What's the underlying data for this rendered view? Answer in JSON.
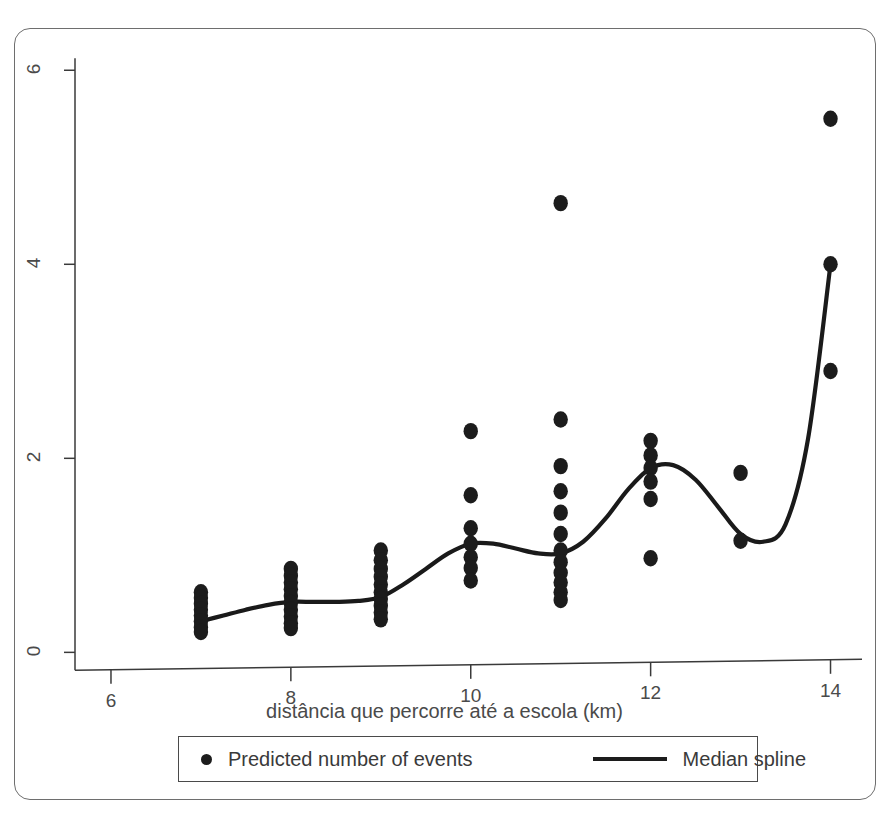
{
  "chart_data": {
    "type": "scatter",
    "title": "",
    "subtitle": "",
    "xlabel": "distância que percorre até a escola (km)",
    "ylabel": "",
    "xlim": [
      5.6,
      14.35
    ],
    "ylim": [
      -0.12,
      6.25
    ],
    "xticks": [
      6,
      8,
      10,
      12,
      14
    ],
    "xticklabels": [
      "6",
      "8",
      "10",
      "12",
      "14"
    ],
    "yticks": [
      0,
      2,
      4,
      6
    ],
    "yticklabels": [
      "0",
      "2",
      "4",
      "6"
    ],
    "ytick_label_rotation": 90,
    "grid": false,
    "legend_position": "below-axes",
    "point_color": "#1c1c1c",
    "line_color": "#1a1a1a",
    "frame_color": "#6e6e6e",
    "legend": [
      {
        "marker": "dot",
        "label": "Predicted number of events"
      },
      {
        "marker": "line",
        "label": "Median spline"
      }
    ],
    "series": [
      {
        "name": "Predicted number of events",
        "marker": "dot",
        "points": [
          {
            "x": 7,
            "y": 0.62
          },
          {
            "x": 7,
            "y": 0.56
          },
          {
            "x": 7,
            "y": 0.5
          },
          {
            "x": 7,
            "y": 0.44
          },
          {
            "x": 7,
            "y": 0.38
          },
          {
            "x": 7,
            "y": 0.32
          },
          {
            "x": 7,
            "y": 0.26
          },
          {
            "x": 7,
            "y": 0.21
          },
          {
            "x": 8,
            "y": 0.86
          },
          {
            "x": 8,
            "y": 0.79
          },
          {
            "x": 8,
            "y": 0.72
          },
          {
            "x": 8,
            "y": 0.65
          },
          {
            "x": 8,
            "y": 0.58
          },
          {
            "x": 8,
            "y": 0.51
          },
          {
            "x": 8,
            "y": 0.44
          },
          {
            "x": 8,
            "y": 0.37
          },
          {
            "x": 8,
            "y": 0.3
          },
          {
            "x": 8,
            "y": 0.25
          },
          {
            "x": 9,
            "y": 1.05
          },
          {
            "x": 9,
            "y": 0.95
          },
          {
            "x": 9,
            "y": 0.86
          },
          {
            "x": 9,
            "y": 0.78
          },
          {
            "x": 9,
            "y": 0.7
          },
          {
            "x": 9,
            "y": 0.62
          },
          {
            "x": 9,
            "y": 0.55
          },
          {
            "x": 9,
            "y": 0.48
          },
          {
            "x": 9,
            "y": 0.41
          },
          {
            "x": 9,
            "y": 0.34
          },
          {
            "x": 10,
            "y": 2.28
          },
          {
            "x": 10,
            "y": 1.62
          },
          {
            "x": 10,
            "y": 1.28
          },
          {
            "x": 10,
            "y": 1.12
          },
          {
            "x": 10,
            "y": 0.98
          },
          {
            "x": 10,
            "y": 0.87
          },
          {
            "x": 10,
            "y": 0.74
          },
          {
            "x": 11,
            "y": 4.63
          },
          {
            "x": 11,
            "y": 2.4
          },
          {
            "x": 11,
            "y": 1.92
          },
          {
            "x": 11,
            "y": 1.66
          },
          {
            "x": 11,
            "y": 1.44
          },
          {
            "x": 11,
            "y": 1.22
          },
          {
            "x": 11,
            "y": 1.05
          },
          {
            "x": 11,
            "y": 0.93
          },
          {
            "x": 11,
            "y": 0.82
          },
          {
            "x": 11,
            "y": 0.72
          },
          {
            "x": 11,
            "y": 0.62
          },
          {
            "x": 11,
            "y": 0.54
          },
          {
            "x": 12,
            "y": 2.18
          },
          {
            "x": 12,
            "y": 2.03
          },
          {
            "x": 12,
            "y": 1.9
          },
          {
            "x": 12,
            "y": 1.76
          },
          {
            "x": 12,
            "y": 1.58
          },
          {
            "x": 12,
            "y": 0.97
          },
          {
            "x": 13,
            "y": 1.85
          },
          {
            "x": 13,
            "y": 1.15
          },
          {
            "x": 14,
            "y": 5.5
          },
          {
            "x": 14,
            "y": 4.0
          },
          {
            "x": 14,
            "y": 2.9
          }
        ]
      },
      {
        "name": "Median spline",
        "marker": "line",
        "x": [
          7.0,
          7.25,
          7.5,
          7.75,
          8.0,
          8.25,
          8.5,
          8.75,
          9.0,
          9.25,
          9.5,
          9.75,
          10.0,
          10.25,
          10.5,
          10.75,
          11.0,
          11.25,
          11.5,
          11.75,
          12.0,
          12.25,
          12.5,
          12.75,
          13.0,
          13.25,
          13.5,
          13.75,
          14.0
        ],
        "y": [
          0.32,
          0.38,
          0.44,
          0.49,
          0.52,
          0.52,
          0.52,
          0.53,
          0.57,
          0.7,
          0.86,
          1.02,
          1.12,
          1.12,
          1.07,
          1.02,
          1.02,
          1.14,
          1.38,
          1.68,
          1.9,
          1.93,
          1.78,
          1.5,
          1.22,
          1.14,
          1.32,
          2.2,
          4.0
        ]
      }
    ]
  },
  "xaxis": {
    "label": "distância que percorre até a escola (km)",
    "ticks": [
      "6",
      "8",
      "10",
      "12",
      "14"
    ]
  },
  "yaxis": {
    "ticks": [
      "0",
      "2",
      "4",
      "6"
    ]
  },
  "legend": {
    "points_label": "Predicted number of events",
    "spline_label": "Median spline"
  }
}
